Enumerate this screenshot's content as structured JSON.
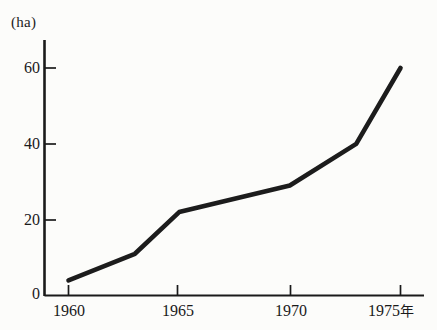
{
  "chart_data": {
    "type": "line",
    "title": "",
    "subtitle": "",
    "xlabel": "年",
    "ylabel": "",
    "unit_label": "(ha)",
    "x": [
      1960,
      1963,
      1965,
      1970,
      1973,
      1975
    ],
    "values": [
      4,
      11,
      22,
      29,
      40,
      60
    ],
    "series": [
      {
        "name": "",
        "x": [
          1960,
          1963,
          1965,
          1970,
          1973,
          1975
        ],
        "values": [
          4,
          11,
          22,
          29,
          40,
          60
        ]
      }
    ],
    "xlim": [
      1959,
      1977
    ],
    "ylim": [
      0,
      68
    ],
    "x_ticks": [
      1960,
      1965,
      1970,
      1975
    ],
    "x_tick_labels": [
      "1960",
      "1965",
      "1970",
      "1975"
    ],
    "y_ticks": [
      0,
      20,
      40,
      60
    ],
    "y_tick_labels": [
      "0",
      "20",
      "40",
      "60"
    ],
    "grid": false,
    "legend": false,
    "legend_position": "none",
    "line_color": "#1a1a1a",
    "background_color": "#fcfcfa"
  },
  "axis": {
    "unit": "(ha)",
    "x_suffix": "年",
    "y_labels": [
      "60",
      "40",
      "20",
      "0"
    ],
    "x_labels": [
      "1960",
      "1965",
      "1970",
      "1975"
    ]
  }
}
